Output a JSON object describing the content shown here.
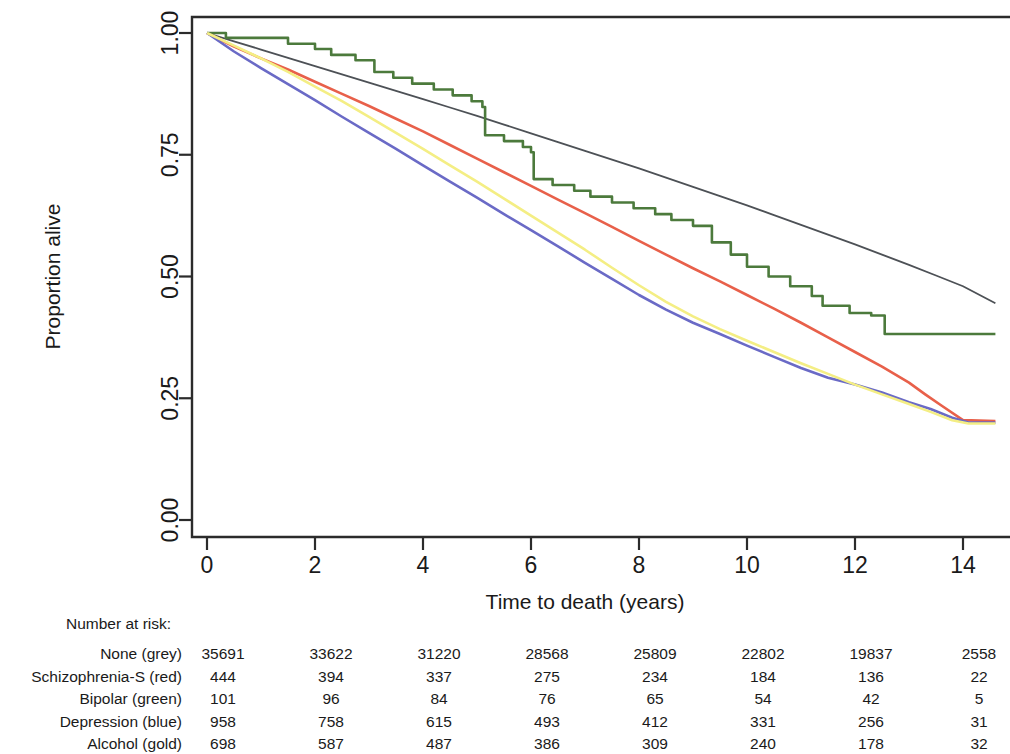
{
  "chart_data": {
    "type": "line",
    "title": "",
    "subtitle": "",
    "xlabel": "Time to death (years)",
    "ylabel": "Proportion alive",
    "xlim": [
      0,
      15
    ],
    "ylim": [
      0.0,
      1.0
    ],
    "xticks": [
      0,
      2,
      4,
      6,
      8,
      10,
      12,
      14
    ],
    "xtick_labels": [
      "0",
      "2",
      "4",
      "6",
      "8",
      "10",
      "12",
      "14"
    ],
    "yticks": [
      0.0,
      0.25,
      0.5,
      0.75,
      1.0
    ],
    "ytick_labels": [
      "0.00",
      "0.25",
      "0.50",
      "0.75",
      "1.00"
    ],
    "grid": false,
    "legend_position": "none",
    "series": [
      {
        "name": "None (grey)",
        "color": "#4d5156",
        "x": [
          0,
          0.5,
          1,
          1.5,
          2,
          2.5,
          3,
          3.5,
          4,
          4.5,
          5,
          5.5,
          6,
          6.5,
          7,
          7.5,
          8,
          8.5,
          9,
          9.5,
          10,
          10.5,
          11,
          11.5,
          12,
          12.5,
          13,
          13.5,
          14,
          14.6
        ],
        "y": [
          1.0,
          0.983,
          0.966,
          0.949,
          0.932,
          0.915,
          0.898,
          0.881,
          0.864,
          0.847,
          0.83,
          0.812,
          0.794,
          0.776,
          0.758,
          0.74,
          0.722,
          0.703,
          0.684,
          0.665,
          0.646,
          0.626,
          0.606,
          0.586,
          0.566,
          0.545,
          0.524,
          0.502,
          0.48,
          0.445
        ]
      },
      {
        "name": "Schizophrenia-S (red)",
        "color": "#e8604a",
        "x": [
          0,
          0.5,
          1,
          1.5,
          2,
          2.5,
          3,
          3.5,
          4,
          4.5,
          5,
          5.5,
          6,
          6.5,
          7,
          7.5,
          8,
          8.5,
          9,
          9.5,
          10,
          10.5,
          11,
          11.5,
          12,
          12.5,
          13,
          13.3,
          13.6,
          14,
          14.6
        ],
        "y": [
          1.0,
          0.972,
          0.948,
          0.925,
          0.9,
          0.875,
          0.85,
          0.824,
          0.798,
          0.77,
          0.742,
          0.714,
          0.686,
          0.658,
          0.63,
          0.602,
          0.573,
          0.545,
          0.517,
          0.49,
          0.462,
          0.434,
          0.405,
          0.375,
          0.345,
          0.315,
          0.282,
          0.258,
          0.235,
          0.205,
          0.203
        ]
      },
      {
        "name": "Bipolar (green)",
        "color": "#4c7a3c",
        "x": [
          0,
          0.35,
          0.9,
          1.5,
          2.0,
          2.3,
          2.75,
          3.05,
          3.1,
          3.45,
          3.8,
          4.2,
          4.55,
          4.9,
          5.1,
          5.15,
          5.5,
          5.85,
          6.0,
          6.05,
          6.4,
          6.8,
          7.1,
          7.5,
          7.9,
          8.3,
          8.6,
          9.0,
          9.35,
          9.7,
          10.0,
          10.4,
          10.8,
          11.2,
          11.4,
          11.9,
          12.3,
          12.5,
          12.55,
          13.0,
          14.6
        ],
        "y": [
          1.0,
          0.99,
          0.99,
          0.978,
          0.967,
          0.955,
          0.944,
          0.944,
          0.92,
          0.908,
          0.896,
          0.884,
          0.872,
          0.86,
          0.848,
          0.79,
          0.778,
          0.766,
          0.755,
          0.7,
          0.688,
          0.676,
          0.664,
          0.652,
          0.64,
          0.628,
          0.616,
          0.604,
          0.57,
          0.545,
          0.52,
          0.5,
          0.48,
          0.46,
          0.44,
          0.425,
          0.42,
          0.42,
          0.382,
          0.382,
          0.382
        ]
      },
      {
        "name": "Depression (blue)",
        "color": "#6a6ac6",
        "x": [
          0,
          0.5,
          1,
          1.5,
          2,
          2.5,
          3,
          3.5,
          4,
          4.5,
          5,
          5.5,
          6,
          6.5,
          7,
          7.5,
          8,
          8.5,
          9,
          9.5,
          10,
          10.5,
          11,
          11.5,
          12,
          12.5,
          13,
          13.4,
          13.8,
          14.1,
          14.6
        ],
        "y": [
          1.0,
          0.962,
          0.928,
          0.895,
          0.862,
          0.828,
          0.795,
          0.762,
          0.728,
          0.695,
          0.662,
          0.628,
          0.595,
          0.562,
          0.528,
          0.495,
          0.462,
          0.432,
          0.405,
          0.382,
          0.358,
          0.335,
          0.312,
          0.292,
          0.278,
          0.262,
          0.242,
          0.228,
          0.21,
          0.2,
          0.2
        ]
      },
      {
        "name": "Alcohol (gold)",
        "color": "#f4ee84",
        "x": [
          0,
          0.5,
          1,
          1.5,
          2,
          2.5,
          3,
          3.5,
          4,
          4.5,
          5,
          5.5,
          6,
          6.5,
          7,
          7.5,
          8,
          8.5,
          9,
          9.5,
          10,
          10.5,
          11,
          11.5,
          12,
          12.5,
          13,
          13.4,
          13.8,
          14.1,
          14.6
        ],
        "y": [
          1.0,
          0.974,
          0.948,
          0.92,
          0.89,
          0.86,
          0.828,
          0.795,
          0.762,
          0.728,
          0.695,
          0.66,
          0.625,
          0.59,
          0.555,
          0.518,
          0.482,
          0.448,
          0.418,
          0.392,
          0.368,
          0.345,
          0.322,
          0.3,
          0.278,
          0.258,
          0.238,
          0.222,
          0.205,
          0.198,
          0.198
        ]
      }
    ]
  },
  "risk_table": {
    "title": "Number at risk:",
    "times": [
      0,
      2,
      4,
      6,
      8,
      10,
      12,
      14
    ],
    "rows": [
      {
        "label": "None (grey)",
        "values": [
          "35691",
          "33622",
          "31220",
          "28568",
          "25809",
          "22802",
          "19837",
          "2558"
        ]
      },
      {
        "label": "Schizophrenia-S (red)",
        "values": [
          "444",
          "394",
          "337",
          "275",
          "234",
          "184",
          "136",
          "22"
        ]
      },
      {
        "label": "Bipolar (green)",
        "values": [
          "101",
          "96",
          "84",
          "76",
          "65",
          "54",
          "42",
          "5"
        ]
      },
      {
        "label": "Depression (blue)",
        "values": [
          "958",
          "758",
          "615",
          "493",
          "412",
          "331",
          "256",
          "31"
        ]
      },
      {
        "label": "Alcohol (gold)",
        "values": [
          "698",
          "587",
          "487",
          "386",
          "309",
          "240",
          "178",
          "32"
        ]
      }
    ]
  }
}
